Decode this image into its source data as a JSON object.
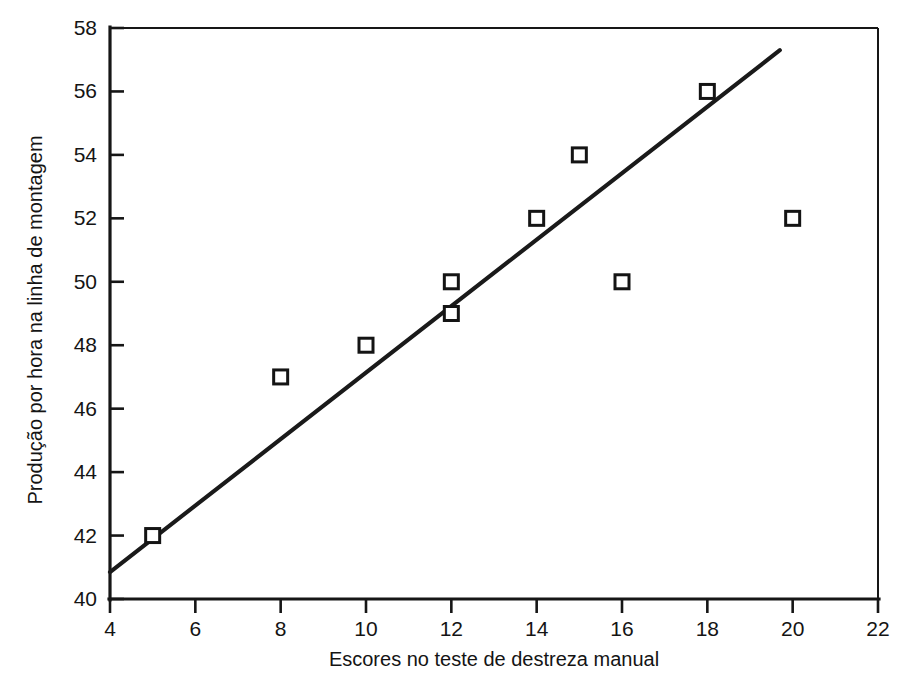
{
  "chart_data": {
    "type": "scatter",
    "title": "",
    "subtitle": "",
    "xlabel": "Escores no teste de destreza manual",
    "ylabel": "Produção por hora na linha de montagem",
    "xlim": [
      4,
      22
    ],
    "ylim": [
      40,
      58
    ],
    "xticks": [
      4,
      6,
      8,
      10,
      12,
      14,
      16,
      18,
      20,
      22
    ],
    "yticks": [
      40,
      42,
      44,
      46,
      48,
      50,
      52,
      54,
      56,
      58
    ],
    "xticklabels": [
      "4",
      "6",
      "8",
      "10",
      "12",
      "14",
      "16",
      "18",
      "20",
      "22"
    ],
    "yticklabels": [
      "40",
      "42",
      "44",
      "46",
      "48",
      "50",
      "52",
      "54",
      "56",
      "58"
    ],
    "grid": false,
    "legend": false,
    "legend_position": "none",
    "marker_style": "open-square",
    "marker_color": "#141414",
    "line_color": "#1a1a1a",
    "series": [
      {
        "name": "Observações",
        "type": "scatter",
        "points": [
          {
            "x": 5,
            "y": 42
          },
          {
            "x": 8,
            "y": 47
          },
          {
            "x": 10,
            "y": 48
          },
          {
            "x": 12,
            "y": 49
          },
          {
            "x": 12,
            "y": 50
          },
          {
            "x": 14,
            "y": 52
          },
          {
            "x": 15,
            "y": 54
          },
          {
            "x": 16,
            "y": 50
          },
          {
            "x": 18,
            "y": 56
          },
          {
            "x": 20,
            "y": 52
          }
        ],
        "x": [
          5,
          8,
          10,
          12,
          12,
          14,
          15,
          16,
          18,
          20
        ],
        "values": [
          42,
          47,
          48,
          49,
          50,
          52,
          54,
          50,
          56,
          52
        ]
      },
      {
        "name": "Reta de regressão",
        "type": "line",
        "points": [
          {
            "x": 4,
            "y": 40.85
          },
          {
            "x": 19.7,
            "y": 57.3
          }
        ]
      }
    ]
  },
  "figure": {
    "background_color": "#ffffff",
    "axis_color": "#161616"
  }
}
